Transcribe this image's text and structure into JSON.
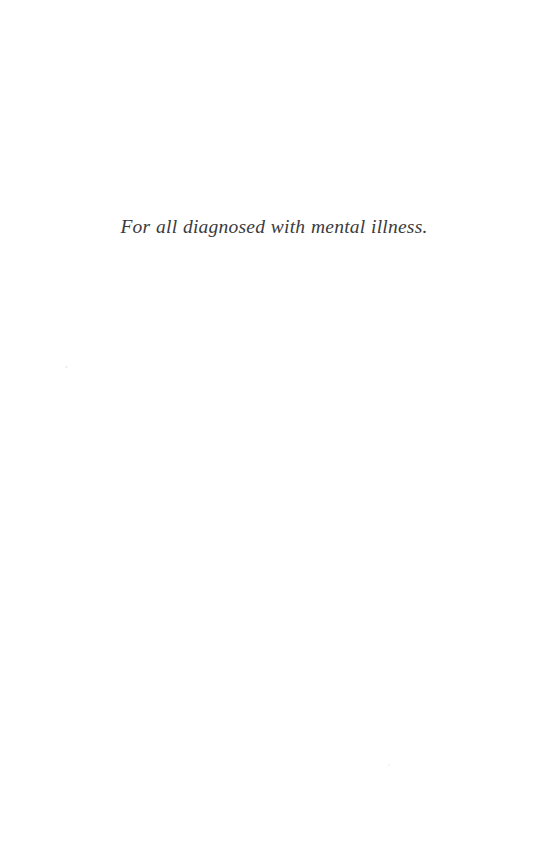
{
  "page": {
    "kind": "dedication-page",
    "background_color": "#ffffff",
    "width": 537,
    "height": 864
  },
  "dedication": {
    "text": "For all diagnosed with mental illness.",
    "text_color": "#3b3b3d",
    "style": "italic",
    "alignment": "center"
  },
  "artifacts": {
    "speck_a_label": "",
    "speck_b_label": ""
  }
}
